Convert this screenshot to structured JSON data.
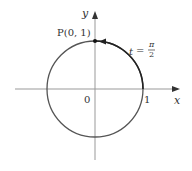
{
  "diagram": {
    "type": "unit-circle",
    "axes": {
      "x_label": "x",
      "y_label": "y",
      "origin_label": "0",
      "x_tick_label": "1"
    },
    "point": {
      "label": "P(0, 1)",
      "coords": [
        0,
        1
      ]
    },
    "parameter": {
      "label_var": "t",
      "label_eq": "=",
      "num": "π",
      "den": "2"
    },
    "colors": {
      "axes": "#999999",
      "circle": "#555555",
      "arc": "#222222",
      "text": "#333333"
    }
  }
}
